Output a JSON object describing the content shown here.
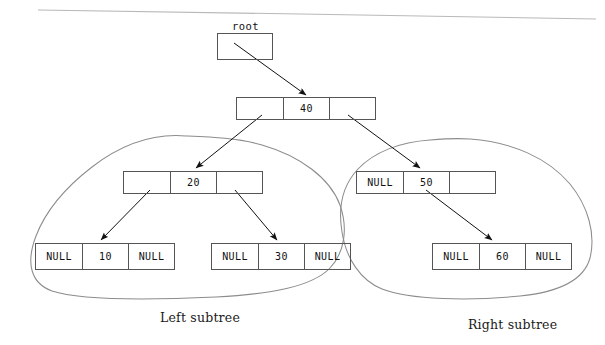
{
  "figure": {
    "title_label": "root",
    "left_subtree_label": "Left subtree",
    "right_subtree_label": "Right subtree",
    "null_text": "NULL",
    "line_color": "#555555",
    "text_color": "#111111",
    "background": "#ffffff"
  },
  "nodes": {
    "root_pointer": {
      "name": "root",
      "left": "",
      "value": "",
      "right": ""
    },
    "n40": {
      "left": "",
      "value": "40",
      "right": ""
    },
    "n20": {
      "left": "",
      "value": "20",
      "right": ""
    },
    "n50": {
      "left": "NULL",
      "value": "50",
      "right": ""
    },
    "n10": {
      "left": "NULL",
      "value": "10",
      "right": "NULL"
    },
    "n30": {
      "left": "NULL",
      "value": "30",
      "right": "NULL"
    },
    "n60": {
      "left": "NULL",
      "value": "60",
      "right": "NULL"
    }
  },
  "tree_data": {
    "type": "binary-search-tree",
    "root_value": "40",
    "levels": [
      [
        "40"
      ],
      [
        "20",
        "50"
      ],
      [
        "10",
        "30",
        "60"
      ]
    ],
    "edges": [
      {
        "from": "root",
        "to": "40"
      },
      {
        "from": "40",
        "to": "20",
        "side": "left"
      },
      {
        "from": "40",
        "to": "50",
        "side": "right"
      },
      {
        "from": "20",
        "to": "10",
        "side": "left"
      },
      {
        "from": "20",
        "to": "30",
        "side": "right"
      },
      {
        "from": "50",
        "to": "60",
        "side": "right"
      }
    ]
  }
}
